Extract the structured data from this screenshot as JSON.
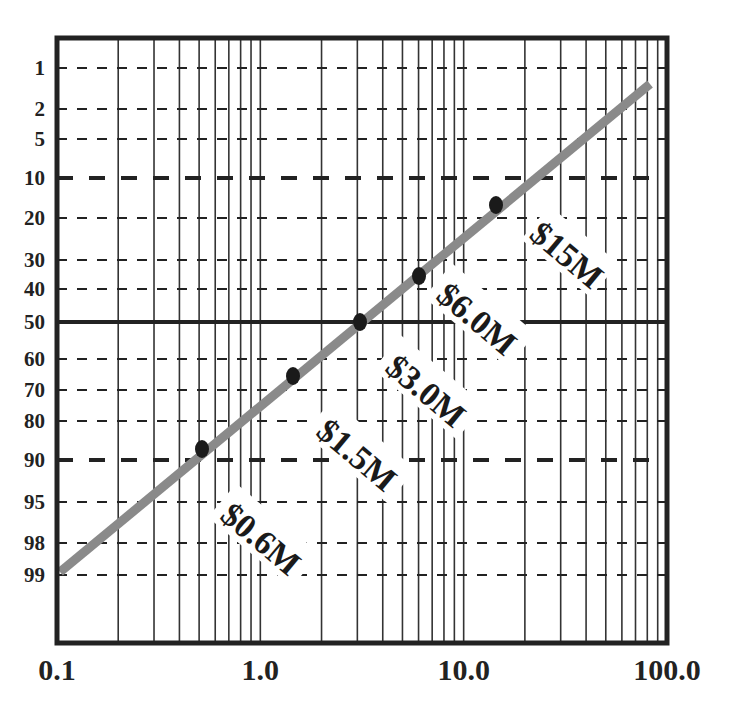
{
  "chart_data": {
    "type": "line",
    "title": "",
    "xlabel": "",
    "ylabel": "",
    "x_scale": "log",
    "y_scale": "probability",
    "xlim": [
      0.1,
      100.0
    ],
    "x_tick_labels": [
      "0.1",
      "1.0",
      "10.0",
      "100.0"
    ],
    "x_ticks": [
      0.1,
      1.0,
      10.0,
      100.0
    ],
    "y_tick_labels": [
      "1",
      "2",
      "5",
      "10",
      "20",
      "30",
      "40",
      "50",
      "60",
      "70",
      "80",
      "90",
      "95",
      "98",
      "99"
    ],
    "y_ticks": [
      1,
      2,
      5,
      10,
      20,
      30,
      40,
      50,
      60,
      70,
      80,
      90,
      95,
      98,
      99
    ],
    "grid": true,
    "emphasized_gridlines": {
      "solid_bold": [
        50
      ],
      "bold_dashed": [
        10,
        90
      ]
    },
    "series": [
      {
        "name": "fit-line",
        "style": "thick gray line",
        "color": "#8a8a8a",
        "x": [
          0.1,
          75
        ],
        "y": [
          99,
          0.7
        ]
      },
      {
        "name": "data-points",
        "style": "black dots",
        "color": "#1a1a1a",
        "x": [
          0.5,
          1.4,
          3.0,
          6.0,
          14.0
        ],
        "y": [
          88,
          66,
          50,
          35,
          17
        ]
      }
    ],
    "annotations": [
      {
        "text": "$0.6M",
        "x": 0.5,
        "y": 88
      },
      {
        "text": "$1.5M",
        "x": 1.4,
        "y": 66
      },
      {
        "text": "$3.0M",
        "x": 3.0,
        "y": 50
      },
      {
        "text": "$6.0M",
        "x": 6.0,
        "y": 35
      },
      {
        "text": "$15M",
        "x": 14.0,
        "y": 17
      }
    ]
  },
  "layout": {
    "frame": {
      "left": 57,
      "top": 38,
      "right": 667,
      "bottom": 643
    },
    "y_pixel": {
      "1": 68,
      "2": 109,
      "5": 139,
      "10": 178,
      "20": 218,
      "30": 260,
      "40": 289,
      "50": 322,
      "60": 359,
      "70": 390,
      "80": 421,
      "90": 460,
      "95": 502,
      "98": 543,
      "99": 575
    },
    "line_px": [
      [
        60,
        572
      ],
      [
        650,
        84
      ]
    ],
    "points_px": [
      [
        202,
        449
      ],
      [
        293,
        376
      ],
      [
        360,
        322
      ],
      [
        419,
        276
      ],
      [
        496,
        205
      ]
    ],
    "label_px": [
      [
        260,
        540
      ],
      [
        356,
        456
      ],
      [
        425,
        392
      ],
      [
        476,
        320
      ],
      [
        566,
        256
      ]
    ],
    "label_rotation": 40
  }
}
